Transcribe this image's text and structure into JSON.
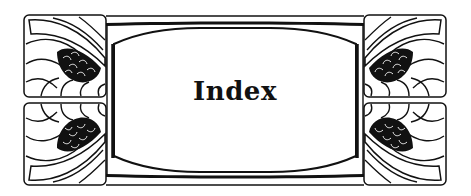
{
  "title": "Index",
  "colors": {
    "ink": "#111111",
    "paper": "#ffffff"
  },
  "ornaments": {
    "tiles": [
      {
        "position": "top-left",
        "motif": "flower-fan-icon"
      },
      {
        "position": "bottom-left",
        "motif": "flower-fan-icon"
      },
      {
        "position": "top-right",
        "motif": "flower-fan-icon"
      },
      {
        "position": "bottom-right",
        "motif": "flower-fan-icon"
      }
    ],
    "frame": "art-nouveau-cartouche"
  }
}
